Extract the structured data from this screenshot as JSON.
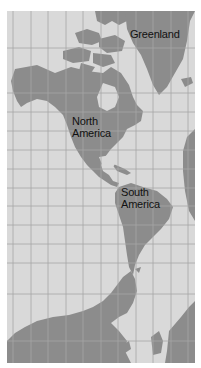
{
  "map": {
    "colors": {
      "ocean": "#d9d9d9",
      "land": "#8c8c8c",
      "grid": "#a6a6a6",
      "text": "#111111"
    },
    "labels": [
      {
        "id": "greenland",
        "text": "Greenland"
      },
      {
        "id": "north-america",
        "text": "North\nAmerica"
      },
      {
        "id": "south-america",
        "text": "South\nAmerica"
      }
    ]
  }
}
